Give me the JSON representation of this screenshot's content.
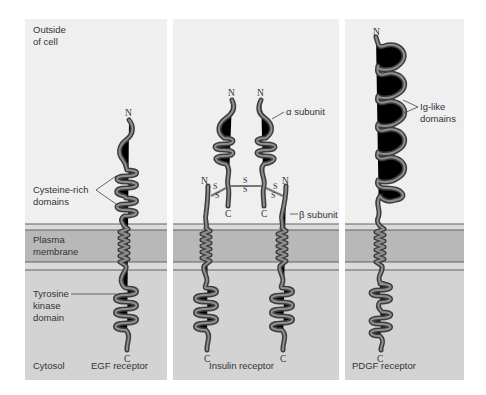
{
  "figure": {
    "colors": {
      "outside_bg": "#efefef",
      "membrane_outer_band": "#d9d9d9",
      "membrane_core": "#b7b7b7",
      "cytosol_bg": "#d2d2d2",
      "membrane_line": "#555555",
      "chain_outline": "#3d3d3d",
      "chain_fill": "#8f8f8f"
    },
    "regions": {
      "outside": "Outside of cell",
      "outside_line1": "Outside",
      "outside_line2": "of cell",
      "membrane_line1": "Plasma",
      "membrane_line2": "membrane",
      "cytosol": "Cytosol"
    },
    "panels": [
      {
        "title": "EGF receptor",
        "labels": {
          "cysteine_line1": "Cysteine-rich",
          "cysteine_line2": "domains",
          "tyrosine_line1": "Tyrosine",
          "tyrosine_line2": "kinase",
          "tyrosine_line3": "domain"
        },
        "n_terminus": "N",
        "c_terminus": "C"
      },
      {
        "title": "Insulin receptor",
        "labels": {
          "alpha": "α subunit",
          "beta": "β subunit",
          "disulfide": "S"
        },
        "n_terminus": "N",
        "c_terminus": "C"
      },
      {
        "title": "PDGF receptor",
        "labels": {
          "ig_line1": "Ig-like",
          "ig_line2": "domains"
        },
        "n_terminus": "N",
        "c_terminus": "C"
      }
    ]
  }
}
